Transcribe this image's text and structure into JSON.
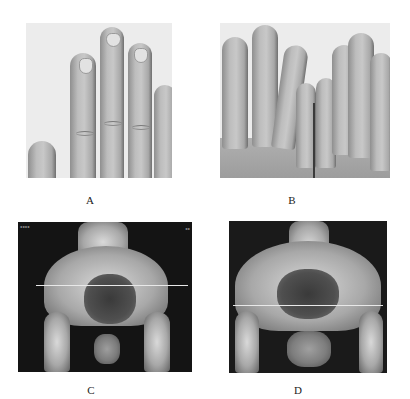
{
  "figure": {
    "panels": [
      {
        "id": "A",
        "label": "A",
        "description": "Hand photograph showing fingers with clubbing-like nail changes"
      },
      {
        "id": "B",
        "label": "B",
        "description": "Both hands photograph showing elongated fingers"
      },
      {
        "id": "C",
        "label": "C",
        "description": "Pelvic X-ray anteroposterior view"
      },
      {
        "id": "D",
        "label": "D",
        "description": "Pelvic X-ray anteroposterior view"
      }
    ]
  }
}
